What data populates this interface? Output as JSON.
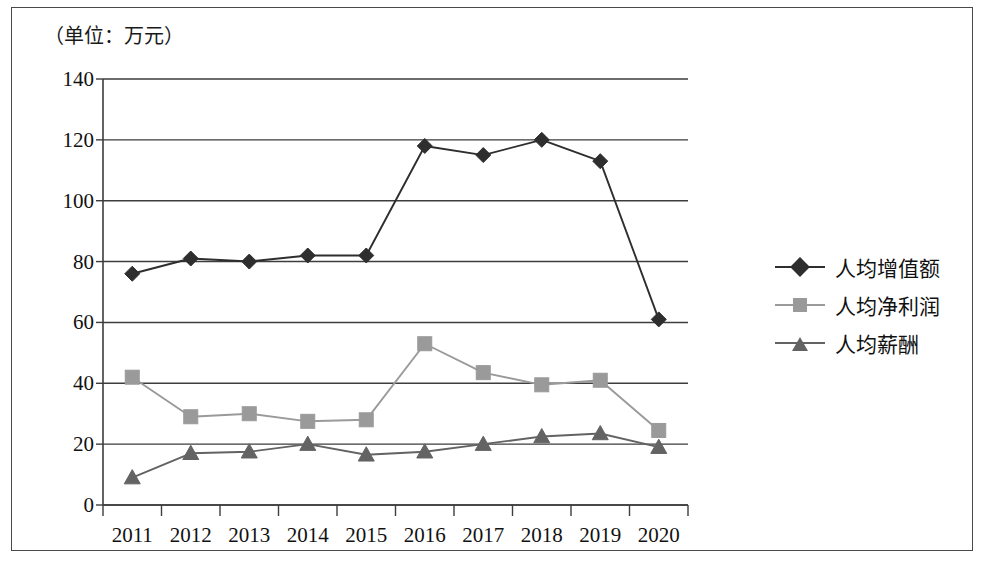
{
  "chart_data": {
    "type": "line",
    "title": "（单位：万元）",
    "xlabel": "",
    "ylabel": "",
    "categories": [
      "2011",
      "2012",
      "2013",
      "2014",
      "2015",
      "2016",
      "2017",
      "2018",
      "2019",
      "2020"
    ],
    "ylim": [
      0,
      140
    ],
    "ytick_labels": [
      "0",
      "20",
      "40",
      "60",
      "80",
      "100",
      "120",
      "140"
    ],
    "ytick_values": [
      0,
      20,
      40,
      60,
      80,
      100,
      120,
      140
    ],
    "grid": "horizontal",
    "legend_position": "right",
    "series": [
      {
        "name": "人均增值额",
        "marker": "diamond",
        "color": "#2e2e2e",
        "values": [
          76,
          81,
          80,
          82,
          82,
          118,
          115,
          120,
          113,
          61
        ]
      },
      {
        "name": "人均净利润",
        "marker": "square",
        "color": "#9a9a9a",
        "values": [
          42,
          29,
          30,
          27.5,
          28,
          53,
          43.5,
          39.5,
          41,
          24.5
        ]
      },
      {
        "name": "人均薪酬",
        "marker": "triangle",
        "color": "#636363",
        "values": [
          9,
          17,
          17.5,
          20,
          16.5,
          17.5,
          20,
          22.5,
          23.5,
          19
        ]
      }
    ]
  },
  "legend": {
    "items": [
      {
        "label": "人均增值额"
      },
      {
        "label": "人均净利润"
      },
      {
        "label": "人均薪酬"
      }
    ]
  }
}
